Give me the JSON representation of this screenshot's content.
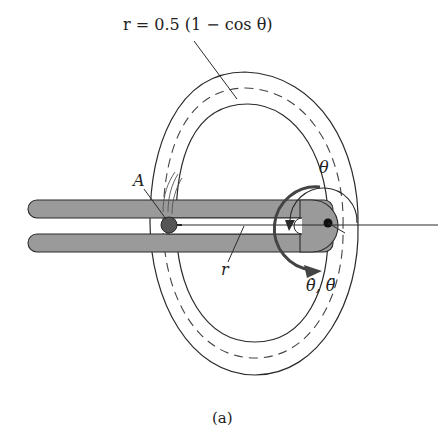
{
  "figure": {
    "equation_label": "r = 0.5 (1 − cos θ)",
    "point_label": "A",
    "angle_label": "θ",
    "radius_label": "r",
    "rates_label": "θ̇, θ̈",
    "caption": "(a)"
  },
  "colors": {
    "stroke": "#2a2a2a",
    "arm_fill": "#9a9a9a",
    "slider_fill": "#555555",
    "background": "#ffffff"
  }
}
